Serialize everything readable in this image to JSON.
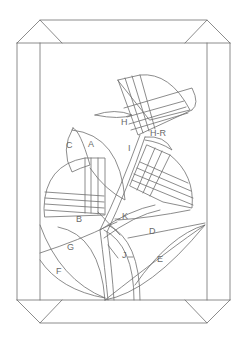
{
  "diagram": {
    "line_color": "#6e6e6e",
    "background": "#ffffff",
    "labels": [
      {
        "id": "A",
        "text": "A",
        "x": 88,
        "y": 147
      },
      {
        "id": "B",
        "text": "B",
        "x": 76,
        "y": 222
      },
      {
        "id": "C",
        "text": "C",
        "x": 66,
        "y": 148
      },
      {
        "id": "D",
        "text": "D",
        "x": 149,
        "y": 234
      },
      {
        "id": "E",
        "text": "E",
        "x": 157,
        "y": 262
      },
      {
        "id": "F",
        "text": "F",
        "x": 56,
        "y": 274
      },
      {
        "id": "G",
        "text": "G",
        "x": 67,
        "y": 250
      },
      {
        "id": "H",
        "text": "H",
        "x": 121,
        "y": 125
      },
      {
        "id": "H-R",
        "text": "H-R",
        "x": 150,
        "y": 136
      },
      {
        "id": "I",
        "text": "I",
        "x": 128,
        "y": 151
      },
      {
        "id": "J",
        "text": "J",
        "x": 122,
        "y": 258
      },
      {
        "id": "K",
        "text": "K",
        "x": 122,
        "y": 219
      }
    ]
  }
}
